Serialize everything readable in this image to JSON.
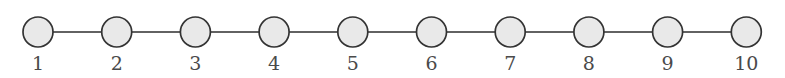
{
  "figure": {
    "background_color": "#ffffff"
  },
  "chart_data": {
    "type": "diagram",
    "diagram_type": "graph",
    "graph_family": "path graph P10",
    "title": "",
    "xlabel": "",
    "ylabel": "",
    "grid": false,
    "legend": "none",
    "node_count": 10,
    "edge_count": 9,
    "layout": "linear-horizontal",
    "node_radius": 15,
    "node_spacing": 78.7,
    "node_center_y": 32,
    "label_y": 70,
    "node_fill": "#e9e9e9",
    "node_stroke": "#333333",
    "edge_stroke": "#2e2e2e",
    "label_color": "#4a4a4a",
    "nodes": [
      {
        "id": 1,
        "label": "1",
        "cx": 38,
        "cy": 32
      },
      {
        "id": 2,
        "label": "2",
        "cx": 116.7,
        "cy": 32
      },
      {
        "id": 3,
        "label": "3",
        "cx": 195.4,
        "cy": 32
      },
      {
        "id": 4,
        "label": "4",
        "cx": 274.1,
        "cy": 32
      },
      {
        "id": 5,
        "label": "5",
        "cx": 352.8,
        "cy": 32
      },
      {
        "id": 6,
        "label": "6",
        "cx": 431.5,
        "cy": 32
      },
      {
        "id": 7,
        "label": "7",
        "cx": 510.2,
        "cy": 32
      },
      {
        "id": 8,
        "label": "8",
        "cx": 588.9,
        "cy": 32
      },
      {
        "id": 9,
        "label": "9",
        "cx": 667.6,
        "cy": 32
      },
      {
        "id": 10,
        "label": "10",
        "cx": 746.3,
        "cy": 32
      }
    ],
    "edges": [
      {
        "source": 1,
        "target": 2
      },
      {
        "source": 2,
        "target": 3
      },
      {
        "source": 3,
        "target": 4
      },
      {
        "source": 4,
        "target": 5
      },
      {
        "source": 5,
        "target": 6
      },
      {
        "source": 6,
        "target": 7
      },
      {
        "source": 7,
        "target": 8
      },
      {
        "source": 8,
        "target": 9
      },
      {
        "source": 9,
        "target": 10
      }
    ]
  }
}
